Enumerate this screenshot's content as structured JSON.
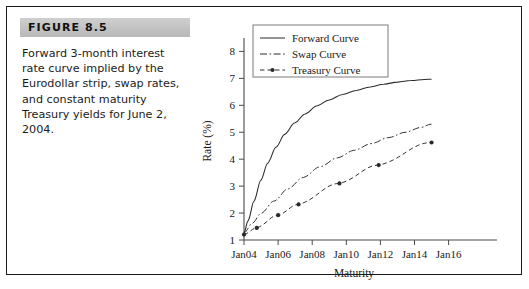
{
  "figure": {
    "banner_label": "FIGURE 8.5",
    "caption": "Forward 3-month interest rate curve implied by the Eurodollar strip, swap rates, and constant maturity Treasury yields for June 2, 2004.",
    "banner_color": "#c4c4c4",
    "frame_color": "#1a1a1a"
  },
  "chart_data": {
    "type": "line",
    "title": "",
    "xlabel": "Maturity",
    "ylabel": "Rate (%)",
    "x_tick_labels": [
      "Jan04",
      "Jan06",
      "Jan08",
      "Jan10",
      "Jan12",
      "Jan14",
      "Jan16"
    ],
    "x_tick_values": [
      2004,
      2006,
      2008,
      2010,
      2012,
      2014,
      2016
    ],
    "y_tick_labels": [
      "1",
      "2",
      "3",
      "4",
      "5",
      "6",
      "7",
      "8"
    ],
    "y_tick_values": [
      1,
      2,
      3,
      4,
      5,
      6,
      7,
      8
    ],
    "xlim": [
      2004,
      2016.2
    ],
    "ylim": [
      1,
      8.35
    ],
    "grid": false,
    "legend_position": "top-left",
    "series": [
      {
        "name": "Forward Curve",
        "style": "solid",
        "marker": "none",
        "color": "#2a2a2a",
        "x": [
          2004.0,
          2004.25,
          2004.6,
          2005.0,
          2005.4,
          2005.9,
          2006.4,
          2007.0,
          2007.6,
          2008.3,
          2009.0,
          2009.8,
          2010.6,
          2011.4,
          2012.2,
          2013.0,
          2013.8,
          2014.6,
          2015.0
        ],
        "y": [
          1.25,
          1.72,
          2.45,
          3.22,
          3.85,
          4.45,
          4.92,
          5.35,
          5.68,
          5.98,
          6.2,
          6.4,
          6.55,
          6.68,
          6.78,
          6.86,
          6.92,
          6.96,
          6.97
        ]
      },
      {
        "name": "Swap Curve",
        "style": "dashdot",
        "marker": "none",
        "color": "#2a2a2a",
        "x": [
          2004.0,
          2004.5,
          2005.0,
          2005.8,
          2006.6,
          2007.5,
          2008.5,
          2009.5,
          2010.5,
          2011.5,
          2012.5,
          2013.5,
          2014.4,
          2015.0
        ],
        "y": [
          1.25,
          1.62,
          1.98,
          2.45,
          2.9,
          3.32,
          3.72,
          4.05,
          4.33,
          4.58,
          4.8,
          5.0,
          5.18,
          5.3
        ]
      },
      {
        "name": "Treasury Curve",
        "style": "dashed",
        "marker": "dot",
        "color": "#2a2a2a",
        "x": [
          2004.0,
          2004.75,
          2006.0,
          2007.2,
          2009.6,
          2011.9,
          2015.0
        ],
        "y": [
          1.2,
          1.45,
          1.92,
          2.32,
          3.1,
          3.78,
          4.62
        ]
      }
    ]
  }
}
